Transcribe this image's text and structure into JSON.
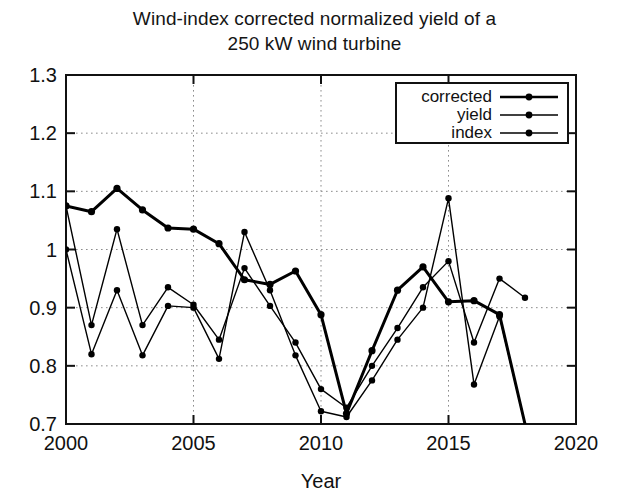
{
  "chart_data": {
    "type": "line",
    "title": "Wind-index corrected normalized yield of a 250 kW wind turbine",
    "title_line1": "Wind-index corrected normalized yield of a",
    "title_line2": "250 kW wind turbine",
    "xlabel": "Year",
    "ylabel": "",
    "xlim": [
      2000,
      2020
    ],
    "ylim": [
      0.7,
      1.3
    ],
    "xticks": [
      2000,
      2005,
      2010,
      2015,
      2020
    ],
    "xtick_labels": [
      "2000",
      "2005",
      "2010",
      "2015",
      "2020"
    ],
    "yticks": [
      0.7,
      0.8,
      0.9,
      1.0,
      1.1,
      1.2,
      1.3
    ],
    "ytick_labels": [
      "0.7",
      "0.8",
      "0.9",
      "1",
      "1.1",
      "1.2",
      "1.3"
    ],
    "grid": "dotted",
    "legend_position": "top-right",
    "x": [
      2000,
      2001,
      2002,
      2003,
      2004,
      2005,
      2006,
      2007,
      2008,
      2009,
      2010,
      2011,
      2012,
      2013,
      2014,
      2015,
      2016,
      2017,
      2018
    ],
    "series": [
      {
        "name": "corrected",
        "color": "#000000",
        "line_width": 3,
        "marker": "filled-circle",
        "values": [
          1.075,
          1.065,
          1.105,
          1.068,
          1.037,
          1.035,
          1.01,
          0.948,
          0.94,
          0.963,
          0.888,
          0.718,
          0.826,
          0.93,
          0.97,
          0.91,
          0.912,
          0.888,
          0.7
        ]
      },
      {
        "name": "yield",
        "color": "#000000",
        "line_width": 1.4,
        "marker": "filled-circle",
        "values": [
          1.075,
          0.87,
          1.035,
          0.87,
          0.935,
          0.905,
          0.845,
          0.968,
          0.903,
          0.84,
          0.76,
          0.728,
          0.8,
          0.865,
          0.935,
          0.98,
          0.84,
          0.95,
          0.917
        ]
      },
      {
        "name": "index",
        "color": "#000000",
        "line_width": 1.4,
        "marker": "filled-circle",
        "values": [
          1.0,
          0.82,
          0.93,
          0.818,
          0.903,
          0.9,
          0.812,
          1.03,
          0.93,
          0.818,
          0.722,
          0.712,
          0.775,
          0.845,
          0.9,
          1.088,
          0.768,
          0.885,
          0.7
        ]
      }
    ],
    "legend_entries": [
      "corrected",
      "yield",
      "index"
    ]
  },
  "plot_geometry": {
    "left": 66,
    "right": 576,
    "top": 75,
    "bottom": 424
  },
  "legend": {
    "box": {
      "x": 396,
      "y": 83,
      "width": 172,
      "height": 60
    }
  }
}
